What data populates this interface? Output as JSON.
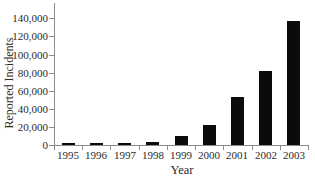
{
  "chart_data": {
    "type": "bar",
    "title": "",
    "xlabel": "Year",
    "ylabel": "Reported Incidents",
    "categories": [
      "1995",
      "1996",
      "1997",
      "1998",
      "1999",
      "2000",
      "2001",
      "2002",
      "2003"
    ],
    "values": [
      2412,
      2573,
      2134,
      3734,
      9859,
      21756,
      52658,
      82094,
      137529
    ],
    "series_name": "Reported Incidents",
    "ylim": [
      0,
      157000
    ],
    "ytick_interval": 20000,
    "ytick_labels": [
      "0",
      "20,000",
      "40,000",
      "60,000",
      "80,000",
      "100,000",
      "120,000",
      "140,000"
    ],
    "grid": false,
    "legend": "none",
    "bar_color": "#0b0b0b",
    "axis_color": "#8a8a8a",
    "text_color": "#2b2b2b",
    "background_color": "#ffffff"
  }
}
